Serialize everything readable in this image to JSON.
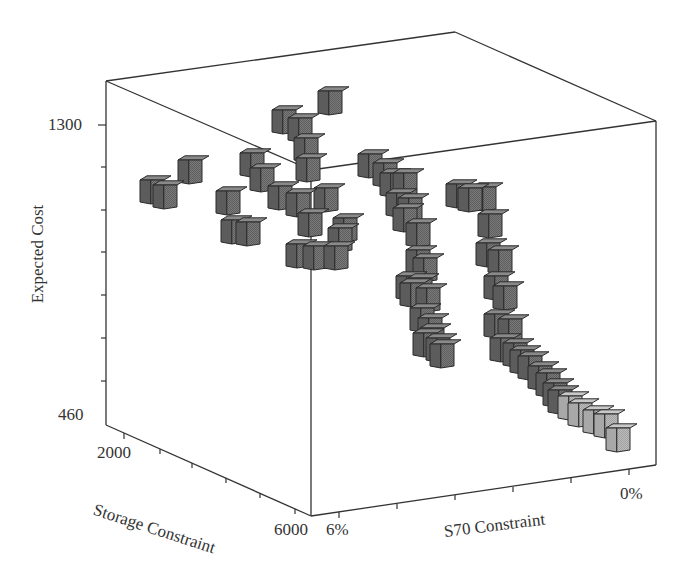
{
  "chart_data": {
    "type": "scatter3d",
    "title": "",
    "axes": {
      "z": {
        "label": "Expected Cost",
        "min": 460,
        "max": 1300,
        "tick_labels": [
          "1300",
          "460"
        ]
      },
      "x": {
        "label": "Storage Constraint",
        "min": 2000,
        "max": 6000,
        "tick_labels": [
          "2000",
          "6000"
        ]
      },
      "y": {
        "label": "S70 Constraint",
        "min": "6%",
        "max": "0%",
        "tick_labels": [
          "6%",
          "0%"
        ]
      }
    },
    "marker": "cube",
    "colors": {
      "cube_dark": "#6e6e6e",
      "cube_light": "#b4b4b4",
      "edge": "#2a2a2a",
      "frame": "#333333"
    },
    "clusters": [
      {
        "name": "low-storage scattered",
        "approx_cost_range": [
          1050,
          1250
        ]
      },
      {
        "name": "front column near 6000 storage",
        "approx_cost_range": [
          950,
          1300
        ]
      },
      {
        "name": "middle curve",
        "approx_cost_range": [
          700,
          1150
        ]
      },
      {
        "name": "right curve toward 0% S70",
        "approx_cost_range": [
          560,
          1100
        ]
      }
    ]
  },
  "labels": {
    "z_top": "1300",
    "z_bottom": "460",
    "z_title": "Expected Cost",
    "x_left": "2000",
    "x_right": "6000",
    "x_title": "Storage Constraint",
    "y_left": "6%",
    "y_right": "0%",
    "y_title": "S70 Constraint"
  }
}
